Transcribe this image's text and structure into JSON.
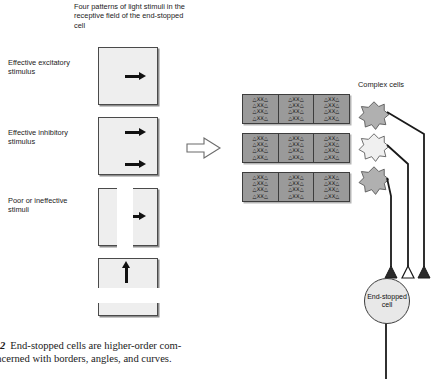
{
  "figure": {
    "header": "Four patterns of light stimuli in the receptive field of the end-stopped cell",
    "block_arrow_icon": "block-arrow-right-icon"
  },
  "stimulus_labels": [
    {
      "id": "excitatory",
      "text": "Effective excitatory stimulus"
    },
    {
      "id": "inhibitory",
      "text": "Effective inhibitory stimulus"
    },
    {
      "id": "poor",
      "text": "Poor or ineffective stimuli"
    }
  ],
  "stimulus_panels": [
    {
      "id": "panel-1",
      "arrows": 1,
      "direction": "right",
      "icon": "arrow-right-icon"
    },
    {
      "id": "panel-2",
      "arrows": 2,
      "direction": "right",
      "icon": "arrow-right-icon"
    },
    {
      "id": "panel-3",
      "arrows": 1,
      "direction": "right",
      "icon": "arrow-right-icon"
    },
    {
      "id": "panel-4",
      "arrows": 1,
      "direction": "up",
      "icon": "arrow-up-icon"
    }
  ],
  "receptive_field": {
    "bands": 3,
    "blocks_per_band": 3,
    "rows_per_block": 4,
    "row_pattern": "△XX△",
    "fill_color": "#9a9a9a",
    "border_color": "#3d3d3d"
  },
  "complex_cells": {
    "label": "Complex cells",
    "cells": [
      {
        "id": "complex-cell-1",
        "fill": "#b0b0b0",
        "terminal": "excitatory"
      },
      {
        "id": "complex-cell-2",
        "fill": "#f0f0f0",
        "terminal": "inhibitory"
      },
      {
        "id": "complex-cell-3",
        "fill": "#b0b0b0",
        "terminal": "excitatory"
      }
    ]
  },
  "end_stopped_cell": {
    "label": "End-stopped cell",
    "terminals": [
      {
        "id": "terminal-left",
        "type": "filled",
        "color": "#2b2b2b"
      },
      {
        "id": "terminal-middle",
        "type": "open",
        "color": "#ffffff"
      },
      {
        "id": "terminal-right",
        "type": "filled",
        "color": "#2b2b2b"
      }
    ]
  },
  "caption": {
    "number": "2",
    "line1": "End-stopped cells are higher-order com-",
    "line2": "oncerned with borders, angles, and curves."
  }
}
